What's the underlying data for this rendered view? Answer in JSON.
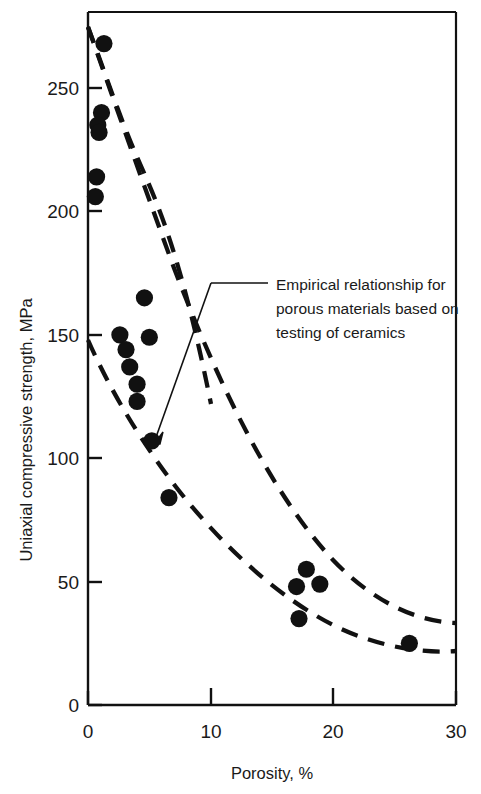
{
  "chart_data": {
    "type": "scatter",
    "title": "",
    "xlabel": "Porosity, %",
    "ylabel": "Uniaxial compressive strength, MPa",
    "xlim": [
      0,
      30
    ],
    "ylim": [
      0,
      275
    ],
    "xticks": [
      0,
      10,
      20,
      30
    ],
    "yticks": [
      0,
      50,
      100,
      150,
      200,
      250
    ],
    "xtick_labels": [
      "0",
      "10",
      "20",
      "30"
    ],
    "ytick_labels": [
      "0",
      "50",
      "100",
      "150",
      "200",
      "250"
    ],
    "grid": false,
    "legend": "none",
    "series": [
      {
        "name": "Measured data",
        "marker": "filled-circle",
        "color": "#111111",
        "points": [
          {
            "x": 1.3,
            "y": 268
          },
          {
            "x": 1.1,
            "y": 240
          },
          {
            "x": 0.8,
            "y": 235
          },
          {
            "x": 0.9,
            "y": 232
          },
          {
            "x": 0.7,
            "y": 214
          },
          {
            "x": 0.6,
            "y": 206
          },
          {
            "x": 4.6,
            "y": 165
          },
          {
            "x": 2.6,
            "y": 150
          },
          {
            "x": 5.0,
            "y": 149
          },
          {
            "x": 3.1,
            "y": 144
          },
          {
            "x": 3.4,
            "y": 137
          },
          {
            "x": 4.0,
            "y": 130
          },
          {
            "x": 4.0,
            "y": 123
          },
          {
            "x": 5.2,
            "y": 107
          },
          {
            "x": 6.6,
            "y": 84
          },
          {
            "x": 17.8,
            "y": 55
          },
          {
            "x": 17.0,
            "y": 48
          },
          {
            "x": 18.9,
            "y": 49
          },
          {
            "x": 17.2,
            "y": 35
          },
          {
            "x": 26.2,
            "y": 25
          }
        ]
      }
    ],
    "curves": [
      {
        "name": "upper-bound-empirical-curve",
        "style": "dashed",
        "color": "#111111",
        "points": [
          {
            "x": 0.0,
            "y": 275
          },
          {
            "x": 2.0,
            "y": 232
          },
          {
            "x": 4.0,
            "y": 196
          },
          {
            "x": 6.0,
            "y": 167
          },
          {
            "x": 8.0,
            "y": 143
          },
          {
            "x": 10.0,
            "y": 122
          },
          {
            "x": 13.0,
            "y": 97
          },
          {
            "x": 16.0,
            "y": 78
          },
          {
            "x": 20.0,
            "y": 59
          },
          {
            "x": 24.0,
            "y": 45
          },
          {
            "x": 27.0,
            "y": 38
          },
          {
            "x": 30.0,
            "y": 33
          }
        ]
      },
      {
        "name": "lower-bound-empirical-curve",
        "style": "dashed",
        "color": "#111111",
        "points": [
          {
            "x": 0.0,
            "y": 148
          },
          {
            "x": 2.0,
            "y": 130
          },
          {
            "x": 4.0,
            "y": 114
          },
          {
            "x": 6.0,
            "y": 99
          },
          {
            "x": 8.0,
            "y": 87
          },
          {
            "x": 10.0,
            "y": 77
          },
          {
            "x": 13.0,
            "y": 64
          },
          {
            "x": 16.0,
            "y": 53
          },
          {
            "x": 20.0,
            "y": 42
          },
          {
            "x": 24.0,
            "y": 32
          },
          {
            "x": 27.0,
            "y": 26
          },
          {
            "x": 30.0,
            "y": 22
          }
        ]
      }
    ],
    "annotations": [
      {
        "name": "empirical-relationship-note",
        "lines": [
          "Empirical relationship for",
          "porous materials based on",
          "testing of ceramics"
        ],
        "leader_target_x": 5.2,
        "leader_target_y": 107
      }
    ]
  },
  "annotation": {
    "line1": "Empirical relationship for",
    "line2": "porous materials based on",
    "line3": "testing of ceramics"
  },
  "axes": {
    "x_title": "Porosity, %",
    "y_title": "Uniaxial compressive strength, MPa",
    "x_tick_0": "0",
    "x_tick_1": "10",
    "x_tick_2": "20",
    "x_tick_3": "30",
    "y_tick_0": "0",
    "y_tick_1": "50",
    "y_tick_2": "100",
    "y_tick_3": "150",
    "y_tick_4": "200",
    "y_tick_5": "250"
  },
  "style": {
    "ink": "#111111",
    "background": "#ffffff"
  }
}
